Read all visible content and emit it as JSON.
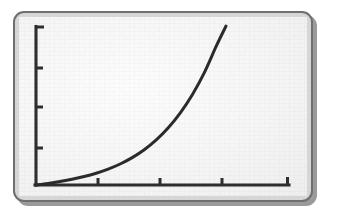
{
  "figure": {
    "background_color": "#ffffff",
    "panel_fill_color": "#d6d6d6",
    "panel_border_color": "#6f6f6f",
    "plot_surface_color": "#f7f7f7",
    "shadow_color": "#9a9a9a",
    "ink_color": "#2e2e2e",
    "frame_style": "rounded-rectangle-with-drop-shadow"
  },
  "chart_data": {
    "type": "line",
    "title": "",
    "subtitle": "",
    "xlabel": "",
    "ylabel": "",
    "legend": [],
    "legend_position": "none",
    "grid": false,
    "xlim": [
      0,
      10
    ],
    "ylim": [
      0,
      10
    ],
    "x_tick_labels": [
      "",
      "",
      "",
      ""
    ],
    "y_tick_labels": [
      "",
      "",
      "",
      ""
    ],
    "x_ticks": [
      2.6,
      5.1,
      7.6,
      10.0
    ],
    "y_ticks": [
      2.6,
      5.2,
      7.7,
      10.0
    ],
    "annotations": [],
    "series": [
      {
        "name": "exponential-growth-curve",
        "color": "#2b2b2b",
        "x": [
          0.0,
          0.5,
          1.0,
          1.5,
          2.0,
          2.5,
          3.0,
          3.5,
          4.0,
          4.5,
          5.0,
          5.5,
          6.0,
          6.5,
          7.0,
          7.5,
          7.9
        ],
        "y": [
          0.0,
          0.1,
          0.22,
          0.36,
          0.53,
          0.74,
          1.0,
          1.32,
          1.72,
          2.22,
          2.84,
          3.6,
          4.54,
          5.68,
          7.07,
          8.75,
          10.0
        ]
      }
    ]
  },
  "geometry": {
    "origin_px": [
      36,
      185
    ],
    "x_axis_end_px": [
      289,
      185
    ],
    "y_axis_top_px": [
      36,
      26
    ],
    "curve_end_px": [
      226,
      26
    ],
    "y_tick_px": [
      26,
      68,
      107,
      148
    ],
    "x_tick_px": [
      98,
      160,
      222,
      287
    ],
    "tick_length_px": 7
  }
}
